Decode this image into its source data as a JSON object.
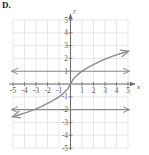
{
  "choice": {
    "label": "D."
  },
  "chart_data": {
    "type": "line",
    "title": "",
    "xlabel": "x",
    "ylabel": "y",
    "xlim": [
      -5.5,
      5.5
    ],
    "ylim": [
      -5.5,
      5.5
    ],
    "grid": true,
    "legend": "none",
    "axis_label_x": "x",
    "axis_label_y": "y",
    "xticks": [
      -5,
      -4,
      -3,
      -2,
      -1,
      1,
      2,
      3,
      4,
      5
    ],
    "yticks": [
      -5,
      -4,
      -3,
      -2,
      -1,
      1,
      2,
      3,
      4,
      5
    ],
    "xtick_labels": [
      "-5",
      "-4",
      "-3",
      "-2",
      "-1",
      "1",
      "2",
      "3",
      "4",
      "5"
    ],
    "ytick_labels": [
      "-5",
      "-4",
      "-3",
      "-2",
      "-1",
      "1",
      "2",
      "3",
      "4",
      "5"
    ],
    "series": [
      {
        "name": "cube-root curve",
        "style": "curve",
        "color": "#8c8c8c",
        "arrows": "both",
        "points": [
          [
            -5.0,
            -2.55
          ],
          [
            -4.5,
            -2.42
          ],
          [
            -4.0,
            -2.28
          ],
          [
            -3.5,
            -2.12
          ],
          [
            -3.0,
            -1.95
          ],
          [
            -2.5,
            -1.75
          ],
          [
            -2.0,
            -1.52
          ],
          [
            -1.5,
            -1.28
          ],
          [
            -1.0,
            -1.0
          ],
          [
            -0.75,
            -0.83
          ],
          [
            -0.5,
            -0.63
          ],
          [
            -0.25,
            -0.4
          ],
          [
            0.0,
            0.0
          ],
          [
            0.25,
            0.4
          ],
          [
            0.5,
            0.63
          ],
          [
            0.75,
            0.83
          ],
          [
            1.0,
            1.0
          ],
          [
            1.5,
            1.28
          ],
          [
            2.0,
            1.52
          ],
          [
            2.5,
            1.75
          ],
          [
            3.0,
            1.95
          ],
          [
            3.5,
            2.12
          ],
          [
            4.0,
            2.28
          ],
          [
            4.5,
            2.42
          ],
          [
            5.0,
            2.55
          ]
        ]
      },
      {
        "name": "horizontal line y=1",
        "style": "horizontal-line",
        "color": "#8c8c8c",
        "y": 1,
        "x_from": -5.1,
        "x_to": 5.1,
        "arrows": "both"
      },
      {
        "name": "horizontal line y=-2",
        "style": "horizontal-line",
        "color": "#8c8c8c",
        "y": -2,
        "x_from": -5.1,
        "x_to": 5.1,
        "arrows": "both"
      }
    ],
    "colors": {
      "grid": "#dcdcdc",
      "axis": "#6e6e6e",
      "curve": "#8c8c8c",
      "label": "#555555",
      "background": "#ffffff"
    }
  }
}
